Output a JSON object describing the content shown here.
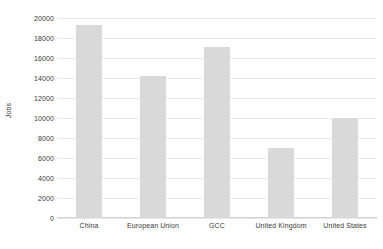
{
  "chart_data": {
    "type": "bar",
    "title": "",
    "subtitle": "",
    "xlabel": "",
    "ylabel": "Jobs",
    "categories": [
      "China",
      "European Union",
      "GCC",
      "United Kingdom",
      "United States"
    ],
    "values": [
      19300,
      14200,
      17100,
      7000,
      10000
    ],
    "series": [
      {
        "name": "Jobs",
        "values": [
          19300,
          14200,
          17100,
          7000,
          10000
        ],
        "color": "#d9d9d9"
      }
    ],
    "ylim": [
      0,
      20000
    ],
    "ytick_step": 2000,
    "ytick_labels": [
      "0",
      "2000",
      "4000",
      "6000",
      "8000",
      "10000",
      "12000",
      "14000",
      "16000",
      "18000",
      "20000"
    ],
    "ytick_values": [
      0,
      2000,
      4000,
      6000,
      8000,
      10000,
      12000,
      14000,
      16000,
      18000,
      20000
    ],
    "grid": true,
    "grid_axis": "y",
    "legend": false,
    "legend_position": "none",
    "annotations": [],
    "bar_color": "#d9d9d9",
    "gridline_color": "#e8e8e8",
    "axis_color": "#d0d0d0",
    "text_color": "#3a3a3a",
    "background": "#ffffff"
  }
}
